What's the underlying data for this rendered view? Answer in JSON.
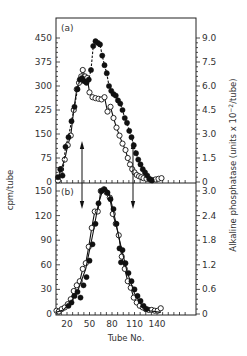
{
  "chart_data": {
    "type": "scatter",
    "title": "",
    "xlabel": "Tube No.",
    "ylabel_left": "cpm/tube",
    "ylabel_right": "Alkaline phosphatase (units x10^-2/tube)",
    "x_ticks": [
      20,
      50,
      80,
      110,
      140
    ],
    "x_tick_labels": [
      "20",
      "50",
      "80",
      "110",
      "140"
    ],
    "xlim": [
      5,
      180
    ],
    "grid": false,
    "legend": "none",
    "panels": [
      {
        "id": "a",
        "tag": "(a)",
        "ylim_left": [
          0,
          450
        ],
        "yticks_left": [
          0,
          75,
          150,
          225,
          300,
          375,
          450
        ],
        "ytick_labels_left": [
          "0",
          "75",
          "150",
          "225",
          "300",
          "375",
          "450"
        ],
        "ylim_right": [
          0,
          9.0
        ],
        "yticks_right": [
          0,
          1.5,
          3.0,
          4.5,
          6.0,
          7.5,
          9.0
        ],
        "ytick_labels_right": [
          "0",
          "1.5",
          "3.0",
          "4.5",
          "6.0",
          "7.5",
          "9.0"
        ],
        "arrows": [
          {
            "x": 40,
            "direction": "up"
          },
          {
            "x": 108,
            "direction": "up"
          }
        ],
        "series": [
          {
            "name": "open circles (cpm)",
            "marker": "open-circle",
            "line": "solid",
            "x": [
              8,
              12,
              17,
              21,
              25,
              29,
              33,
              36,
              39,
              41,
              44,
              47,
              50,
              54,
              58,
              62,
              66,
              70,
              74,
              78,
              82,
              86,
              90,
              94,
              98,
              101,
              104,
              107,
              110,
              113,
              116,
              119,
              122,
              126,
              130,
              134,
              138,
              142,
              146
            ],
            "values": [
              5,
              40,
              70,
              115,
              145,
              225,
              290,
              310,
              330,
              350,
              330,
              325,
              280,
              265,
              262,
              260,
              258,
              265,
              220,
              235,
              200,
              170,
              145,
              120,
              100,
              75,
              55,
              40,
              30,
              22,
              18,
              15,
              12,
              10,
              8,
              6,
              8,
              10,
              12
            ]
          },
          {
            "name": "filled circles (alkaline phosphatase)",
            "marker": "filled-circle",
            "line": "dashed",
            "x": [
              8,
              11,
              14,
              18,
              22,
              26,
              30,
              34,
              37,
              40,
              43,
              46,
              49,
              52,
              55,
              58,
              61,
              64,
              67,
              70,
              73,
              76,
              79,
              82,
              85,
              88,
              91,
              94,
              97,
              100,
              103,
              106,
              109,
              112,
              115,
              118,
              121,
              124,
              127,
              130,
              133
            ],
            "values": [
              15,
              40,
              20,
              110,
              140,
              190,
              235,
              290,
              320,
              325,
              315,
              310,
              320,
              350,
              425,
              440,
              435,
              430,
              395,
              365,
              340,
              300,
              285,
              275,
              270,
              255,
              245,
              225,
              200,
              185,
              160,
              140,
              115,
              90,
              70,
              55,
              40,
              30,
              20,
              10,
              5
            ]
          }
        ]
      },
      {
        "id": "b",
        "tag": "(b)",
        "ylim_left": [
          0,
          150
        ],
        "yticks_left": [
          0,
          30,
          60,
          90,
          120,
          150
        ],
        "ytick_labels_left": [
          "0",
          "30",
          "60",
          "90",
          "120",
          "150"
        ],
        "ylim_right": [
          0,
          3.0
        ],
        "yticks_right": [
          0,
          0.6,
          1.2,
          1.8,
          2.4,
          3.0
        ],
        "ytick_labels_right": [
          "0",
          "0.6",
          "1.2",
          "1.8",
          "2.4",
          "3.0"
        ],
        "arrows": [
          {
            "x": 40,
            "direction": "down"
          },
          {
            "x": 108,
            "direction": "down"
          }
        ],
        "series": [
          {
            "name": "open circles (cpm)",
            "marker": "open-circle",
            "line": "solid",
            "x": [
              6,
              9,
              13,
              17,
              21,
              25,
              29,
              33,
              37,
              41,
              45,
              49,
              53,
              57,
              61,
              65,
              69,
              73,
              77,
              81,
              85,
              89,
              93,
              97,
              101,
              105,
              109,
              113,
              117,
              121,
              125,
              129,
              133,
              137,
              141,
              145
            ],
            "values": [
              4,
              3,
              6,
              8,
              12,
              18,
              28,
              35,
              40,
              55,
              62,
              82,
              105,
              125,
              125,
              150,
              152,
              148,
              142,
              122,
              110,
              96,
              70,
              55,
              40,
              32,
              20,
              14,
              10,
              8,
              6,
              5,
              5,
              4,
              4,
              7
            ]
          },
          {
            "name": "filled circles (alkaline phosphatase)",
            "marker": "filled-circle",
            "line": "none",
            "x": [
              22,
              26,
              30,
              34,
              38,
              42,
              46,
              50,
              54,
              58,
              62,
              66,
              70,
              74,
              78,
              82,
              86,
              90,
              92,
              94,
              98,
              102,
              106,
              110,
              114,
              118,
              122,
              126
            ],
            "values": [
              10,
              14,
              22,
              27,
              20,
              35,
              45,
              65,
              85,
              110,
              135,
              150,
              152,
              148,
              140,
              128,
              110,
              80,
              63,
              78,
              62,
              50,
              40,
              30,
              22,
              16,
              10,
              6
            ]
          },
          {
            "name": "fitted curve",
            "marker": "none",
            "line": "solid",
            "x": [
              5,
              15,
              25,
              35,
              45,
              55,
              62,
              68,
              72,
              76,
              82,
              90,
              100,
              110,
              120,
              130,
              145
            ],
            "values": [
              2,
              5,
              14,
              30,
              55,
              100,
              135,
              152,
              153,
              148,
              125,
              90,
              52,
              25,
              10,
              4,
              2
            ]
          }
        ]
      }
    ]
  },
  "labels": {
    "panel_a_tag": "(a)",
    "panel_b_tag": "(b)",
    "xlabel": "Tube No.",
    "ylabel_left": "cpm/tube",
    "ylabel_right_main": "Alkaline phosphatase (units x 10",
    "ylabel_right_exp": "−2",
    "ylabel_right_end": "/tube)"
  }
}
